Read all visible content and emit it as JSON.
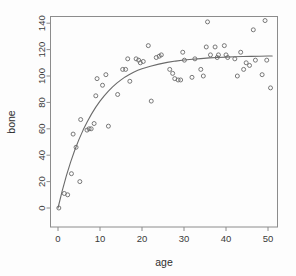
{
  "chart_data": {
    "type": "scatter",
    "title": "",
    "xlabel": "age",
    "ylabel": "bone",
    "xlim": [
      -1.5,
      52.5
    ],
    "ylim": [
      -6,
      148
    ],
    "grid": false,
    "legend": "none",
    "xticks": [
      0,
      10,
      20,
      30,
      40,
      50
    ],
    "yticks": [
      0,
      20,
      40,
      60,
      80,
      100,
      120,
      140
    ],
    "xtick_labels": [
      "0",
      "10",
      "20",
      "30",
      "40",
      "50"
    ],
    "ytick_labels": [
      "0",
      "20",
      "40",
      "60",
      "80",
      "100",
      "120",
      "140"
    ],
    "marker": "open-circle",
    "point_color": "#6a6a6a",
    "line_color": "#6a6a6a",
    "frame_color": "#8c8c8c",
    "background": "#fdfdfd",
    "series": [
      {
        "name": "bone",
        "x": [
          0.2,
          1.5,
          2.3,
          3.2,
          3.6,
          4.3,
          5.2,
          5.4,
          6.9,
          7.4,
          7.9,
          8.6,
          9.0,
          9.3,
          10.6,
          11.4,
          12.0,
          14.2,
          15.4,
          16.1,
          16.6,
          17.1,
          18.6,
          19.2,
          19.6,
          20.3,
          21.5,
          22.2,
          23.4,
          24.1,
          24.6,
          26.6,
          27.3,
          27.8,
          28.6,
          29.2,
          29.7,
          30.1,
          31.9,
          32.6,
          34.0,
          34.6,
          35.3,
          35.6,
          36.3,
          37.4,
          37.9,
          38.2,
          39.6,
          40.0,
          40.4,
          42.1,
          42.7,
          43.5,
          44.2,
          44.8,
          45.6,
          46.5,
          47.0,
          48.6,
          49.3,
          49.7,
          50.6
        ],
        "y": [
          0,
          11,
          10,
          26,
          56,
          46,
          20,
          67,
          59,
          60,
          60,
          64,
          85,
          98,
          93,
          101,
          62,
          86,
          105,
          105,
          113,
          96,
          113,
          112,
          110,
          111,
          123,
          81,
          114,
          115,
          116,
          105,
          102,
          98,
          97,
          97,
          118,
          112,
          99,
          113,
          105,
          100,
          122,
          141,
          116,
          122,
          114,
          116,
          123,
          116,
          114,
          113,
          100,
          118,
          105,
          110,
          108,
          135,
          112,
          101,
          142,
          112,
          91
        ]
      }
    ],
    "fit_curve": {
      "name": "fitted smooth curve",
      "model": "asymptotic-growth",
      "asymptote": 115,
      "x": [
        0,
        1,
        2,
        3,
        4,
        5,
        6,
        7,
        8,
        9,
        10,
        11,
        12,
        13,
        14,
        15,
        16,
        17,
        18,
        19,
        20,
        22,
        24,
        26,
        28,
        30,
        32,
        34,
        36,
        38,
        40,
        42,
        44,
        46,
        48,
        50,
        51
      ],
      "y": [
        0,
        13.0,
        24.5,
        34.8,
        43.9,
        52.0,
        59.2,
        65.6,
        71.3,
        76.4,
        81.0,
        85.0,
        88.6,
        91.8,
        94.6,
        97.1,
        99.3,
        101.2,
        102.9,
        104.3,
        105.5,
        107.4,
        109.0,
        110.3,
        111.3,
        112.1,
        112.7,
        113.2,
        113.7,
        114.0,
        114.3,
        114.6,
        114.8,
        114.9,
        115.0,
        115.1,
        115.1
      ]
    }
  },
  "axes": {
    "x_title": "age",
    "y_title": "bone"
  }
}
